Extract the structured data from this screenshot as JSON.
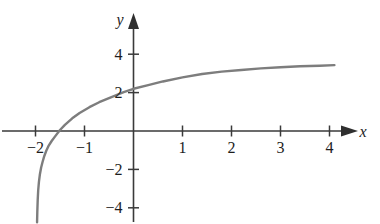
{
  "figure": {
    "background_color": "#ffffff",
    "width": 380,
    "height": 224
  },
  "chart_data": {
    "type": "line",
    "title": "",
    "subtitle": "",
    "xlabel": "x",
    "ylabel": "y",
    "xlim": [
      -2.2,
      4.6
    ],
    "ylim": [
      -4.8,
      4.6
    ],
    "grid": false,
    "legend": null,
    "axis_style": "cartesian-arrows",
    "curve_color": "#7d7d7d",
    "curve_width": 2.4,
    "axis_color": "#3a3a3a",
    "annotations": [],
    "x_ticks": [
      -2,
      -1,
      1,
      2,
      3,
      4
    ],
    "x_tick_labels": [
      "−2",
      "−1",
      "1",
      "2",
      "3",
      "4"
    ],
    "y_ticks": [
      4,
      2,
      -2,
      -4
    ],
    "y_tick_labels": [
      "4",
      "2",
      "−2",
      "−4"
    ],
    "vertical_asymptote": -1.97,
    "x_intercept": -1.84,
    "y_intercept": 2.28,
    "series": [
      {
        "name": "curve",
        "x": [
          -1.968,
          -1.963,
          -1.955,
          -1.945,
          -1.93,
          -1.91,
          -1.885,
          -1.855,
          -1.82,
          -1.78,
          -1.73,
          -1.67,
          -1.6,
          -1.5,
          -1.4,
          -1.25,
          -1.1,
          -0.9,
          -0.7,
          -0.45,
          -0.2,
          0.0,
          0.3,
          0.6,
          1.0,
          1.4,
          1.8,
          2.2,
          2.6,
          3.0,
          3.4,
          3.8,
          4.1
        ],
        "y": [
          -4.75,
          -4.2,
          -3.6,
          -3.1,
          -2.65,
          -2.25,
          -1.9,
          -1.6,
          -1.3,
          -1.03,
          -0.76,
          -0.52,
          -0.28,
          0.05,
          0.32,
          0.66,
          0.94,
          1.24,
          1.5,
          1.77,
          2.02,
          2.2,
          2.39,
          2.58,
          2.79,
          2.97,
          3.09,
          3.18,
          3.26,
          3.32,
          3.37,
          3.4,
          3.43
        ]
      }
    ]
  }
}
